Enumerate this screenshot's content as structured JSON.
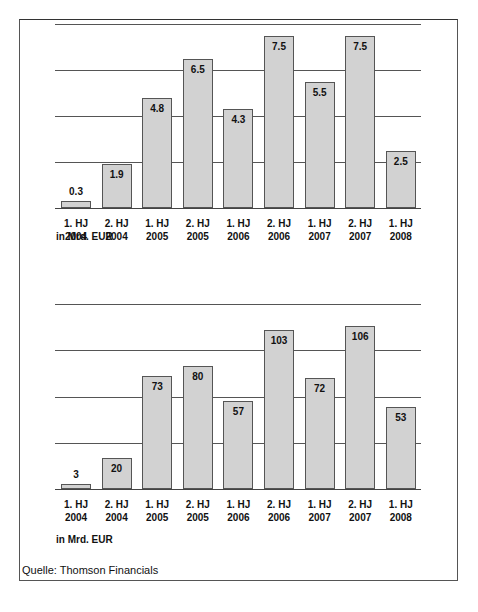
{
  "chart_data": [
    {
      "type": "bar",
      "title": "",
      "categories": [
        "1. HJ 2004",
        "2. HJ 2004",
        "1. HJ 2005",
        "2. HJ 2005",
        "1. HJ 2006",
        "2. HJ 2006",
        "1. HJ 2007",
        "2. HJ 2007",
        "1. HJ 2008"
      ],
      "values": [
        0.3,
        1.9,
        4.8,
        6.5,
        4.3,
        7.5,
        5.5,
        7.5,
        2.5
      ],
      "value_labels": [
        "0.3",
        "1.9",
        "4.8",
        "6.5",
        "4.3",
        "7.5",
        "5.5",
        "7.5",
        "2.5"
      ],
      "xlabel": "",
      "ylabel": "in Mrd. EUR",
      "ylim": [
        0,
        8
      ],
      "gridlines": [
        0,
        2,
        4,
        6,
        8
      ],
      "grid": true,
      "legend": null
    },
    {
      "type": "bar",
      "title": "",
      "categories": [
        "1. HJ 2004",
        "2. HJ 2004",
        "1. HJ 2005",
        "2. HJ 2005",
        "1. HJ 2006",
        "2. HJ 2006",
        "1. HJ 2007",
        "2. HJ 2007",
        "1. HJ 2008"
      ],
      "values": [
        3,
        20,
        73,
        80,
        57,
        103,
        72,
        106,
        53
      ],
      "value_labels": [
        "3",
        "20",
        "73",
        "80",
        "57",
        "103",
        "72",
        "106",
        "53"
      ],
      "xlabel": "",
      "ylabel": "in Mrd. EUR",
      "ylim": [
        0,
        120
      ],
      "gridlines": [
        0,
        30,
        60,
        90,
        120
      ],
      "grid": true,
      "legend": null
    }
  ],
  "labels": {
    "x_line1": [
      "1. HJ",
      "2. HJ",
      "1. HJ",
      "2. HJ",
      "1. HJ",
      "2. HJ",
      "1. HJ",
      "2. HJ",
      "1. HJ"
    ],
    "x_line2": [
      "2004",
      "2004",
      "2005",
      "2005",
      "2006",
      "2006",
      "2007",
      "2007",
      "2008"
    ],
    "unit_top": "in Mrd. EUR",
    "unit_bottom": "in Mrd. EUR",
    "source": "Quelle: Thomson Financials"
  },
  "colors": {
    "bar_fill": "#d2d2d2",
    "bar_border": "#555555",
    "gridline": "#555555",
    "text": "#111111"
  }
}
